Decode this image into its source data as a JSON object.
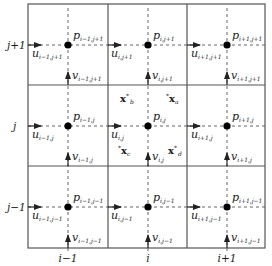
{
  "figure": {
    "colors": {
      "grid_line": "#555555",
      "dashed_line": "#666666",
      "node": "#000000",
      "arrow": "#222222",
      "text": "#1a1a1a"
    }
  },
  "axes": {
    "columns": [
      {
        "label": "i−1",
        "x": 68
      },
      {
        "label": "i",
        "x": 148
      },
      {
        "label": "i+1",
        "x": 227
      }
    ],
    "rows": [
      {
        "label": "j+1",
        "y": 45
      },
      {
        "label": "j",
        "y": 126
      },
      {
        "label": "j−1",
        "y": 207
      }
    ]
  },
  "grid": {
    "x_lines": [
      28,
      108,
      187,
      265
    ],
    "y_lines": [
      4,
      85,
      166,
      248
    ]
  },
  "cells": [
    {
      "row": "j+1",
      "col": "i-1",
      "p": {
        "main": "p",
        "sub": "i−1,j+1"
      },
      "u": {
        "main": "u",
        "sub": "i−1,j+1"
      },
      "v": {
        "main": "v",
        "sub": "i−1,j+1"
      }
    },
    {
      "row": "j+1",
      "col": "i",
      "p": {
        "main": "p",
        "sub": "i,j+1"
      },
      "u": {
        "main": "u",
        "sub": "i,j+1"
      },
      "v": {
        "main": "v",
        "sub": "i,j+1"
      }
    },
    {
      "row": "j+1",
      "col": "i+1",
      "p": {
        "main": "p",
        "sub": "i+1,j+1"
      },
      "u": {
        "main": "u",
        "sub": "i+1,j+1"
      },
      "v": {
        "main": "v",
        "sub": "i+1,j+1"
      }
    },
    {
      "row": "j",
      "col": "i-1",
      "p": {
        "main": "p",
        "sub": "i−1,j"
      },
      "u": {
        "main": "u",
        "sub": "i−1,j"
      },
      "v": {
        "main": "v",
        "sub": "i−1,j"
      }
    },
    {
      "row": "j",
      "col": "i",
      "p": {
        "main": "p",
        "sub": "i,j"
      },
      "u": {
        "main": "u",
        "sub": "i,j"
      },
      "v": {
        "main": "v",
        "sub": "i,j"
      }
    },
    {
      "row": "j",
      "col": "i+1",
      "p": {
        "main": "p",
        "sub": "i+1,j"
      },
      "u": {
        "main": "u",
        "sub": "i+1,j"
      },
      "v": {
        "main": "v",
        "sub": "i+1,j"
      }
    },
    {
      "row": "j−1",
      "col": "i-1",
      "p": {
        "main": "p",
        "sub": "i−1,j−1"
      },
      "u": {
        "main": "u",
        "sub": "i−1,j−1"
      },
      "v": {
        "main": "v",
        "sub": "i−1,j−1"
      }
    },
    {
      "row": "j−1",
      "col": "i",
      "p": {
        "main": "p",
        "sub": "i,j−1"
      },
      "u": {
        "main": "u",
        "sub": "i,j−1"
      },
      "v": {
        "main": "v",
        "sub": "i,j−1"
      }
    },
    {
      "row": "j−1",
      "col": "i+1",
      "p": {
        "main": "p",
        "sub": "i+1,j−1"
      },
      "u": {
        "main": "u",
        "sub": "i+1,j−1"
      },
      "v": {
        "main": "v",
        "sub": "i+1,j−1"
      }
    }
  ],
  "points": [
    {
      "id": "a",
      "main": "x",
      "star": "*",
      "sub": "a",
      "star_position": "before"
    },
    {
      "id": "b",
      "main": "x",
      "star": "*",
      "sub": "b",
      "star_position": "after"
    },
    {
      "id": "c",
      "main": "x",
      "star": "*",
      "sub": "c",
      "star_position": "before"
    },
    {
      "id": "d",
      "main": "x",
      "star": "*",
      "sub": "d",
      "star_position": "after"
    }
  ]
}
